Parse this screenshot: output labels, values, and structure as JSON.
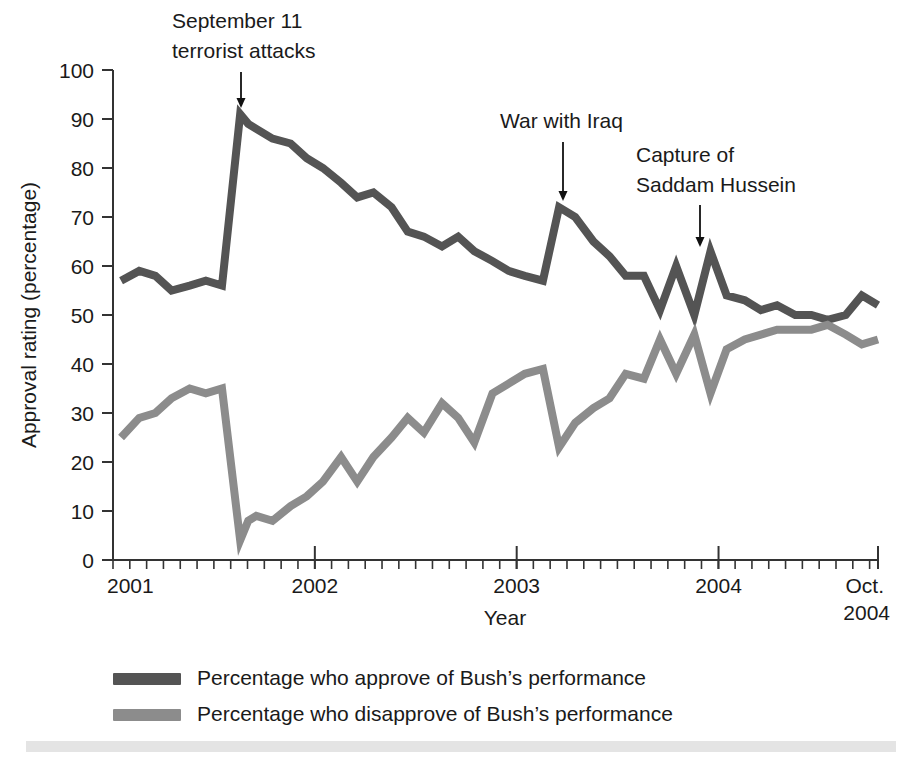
{
  "chart_data": {
    "type": "line",
    "title": "",
    "xlabel": "Year",
    "ylabel": "Approval rating (percentage)",
    "ylim": [
      0,
      100
    ],
    "yticks": [
      0,
      10,
      20,
      30,
      40,
      50,
      60,
      70,
      80,
      90,
      100
    ],
    "xlim": [
      2001.0,
      2004.79
    ],
    "xtick_labels": [
      "2001",
      "2002",
      "2003",
      "2004",
      "Oct.\n2004"
    ],
    "xtick_values": [
      2001,
      2002,
      2003,
      2004,
      2004.79
    ],
    "xtick_minor_interval": 0.0833,
    "grid": false,
    "legend_position": "below",
    "series": [
      {
        "name": "Percentage who approve of Bush's performance",
        "color": "#545454",
        "x": [
          2001.04,
          2001.13,
          2001.21,
          2001.29,
          2001.38,
          2001.46,
          2001.54,
          2001.63,
          2001.67,
          2001.71,
          2001.79,
          2001.88,
          2001.96,
          2002.04,
          2002.13,
          2002.21,
          2002.29,
          2002.38,
          2002.46,
          2002.54,
          2002.63,
          2002.71,
          2002.79,
          2002.88,
          2002.96,
          2003.04,
          2003.13,
          2003.21,
          2003.29,
          2003.38,
          2003.46,
          2003.54,
          2003.63,
          2003.71,
          2003.79,
          2003.88,
          2003.96,
          2004.04,
          2004.13,
          2004.21,
          2004.29,
          2004.38,
          2004.46,
          2004.54,
          2004.63,
          2004.71,
          2004.79
        ],
        "y": [
          57,
          59,
          58,
          55,
          56,
          57,
          56,
          91,
          89,
          88,
          86,
          85,
          82,
          80,
          77,
          74,
          75,
          72,
          67,
          66,
          64,
          66,
          63,
          61,
          59,
          58,
          57,
          72,
          70,
          65,
          62,
          58,
          58,
          51,
          60,
          50,
          63,
          54,
          53,
          51,
          52,
          50,
          50,
          49,
          50,
          54,
          52
        ],
        "marker": "none"
      },
      {
        "name": "Percentage who disapprove of Bush's performance",
        "color": "#8c8c8c",
        "x": [
          2001.04,
          2001.13,
          2001.21,
          2001.29,
          2001.38,
          2001.46,
          2001.54,
          2001.63,
          2001.67,
          2001.71,
          2001.79,
          2001.88,
          2001.96,
          2002.04,
          2002.13,
          2002.21,
          2002.29,
          2002.38,
          2002.46,
          2002.54,
          2002.63,
          2002.71,
          2002.79,
          2002.88,
          2002.96,
          2003.04,
          2003.13,
          2003.21,
          2003.29,
          2003.38,
          2003.46,
          2003.54,
          2003.63,
          2003.71,
          2003.79,
          2003.88,
          2003.96,
          2004.04,
          2004.13,
          2004.21,
          2004.29,
          2004.38,
          2004.46,
          2004.54,
          2004.63,
          2004.71,
          2004.79
        ],
        "y": [
          25,
          29,
          30,
          33,
          35,
          34,
          35,
          4,
          8,
          9,
          8,
          11,
          13,
          16,
          21,
          16,
          21,
          25,
          29,
          26,
          32,
          29,
          24,
          34,
          36,
          38,
          39,
          23,
          28,
          31,
          33,
          38,
          37,
          45,
          38,
          46,
          34,
          43,
          45,
          46,
          47,
          47,
          47,
          48,
          46,
          44,
          45
        ],
        "marker": "none"
      }
    ],
    "annotations": [
      {
        "name": "september-11",
        "text_line1": "September 11",
        "text_line2": "terrorist attacks",
        "target_x": 2001.63,
        "target_y": 95
      },
      {
        "name": "war-with-iraq",
        "text_line1": "War with Iraq",
        "text_line2": "",
        "target_x": 2003.21,
        "target_y": 76
      },
      {
        "name": "capture-of-saddam",
        "text_line1": "Capture of",
        "text_line2": "Saddam Hussein",
        "target_x": 2003.96,
        "target_y": 67
      }
    ]
  },
  "legend": {
    "items": [
      {
        "label": "Percentage who approve of Bush’s performance",
        "color": "#545454"
      },
      {
        "label": "Percentage who disapprove of Bush’s performance",
        "color": "#8c8c8c"
      }
    ]
  },
  "axes": {
    "y_title": "Approval rating (percentage)",
    "x_title": "Year",
    "y_ticks": [
      "100",
      "90",
      "80",
      "70",
      "60",
      "50",
      "40",
      "30",
      "20",
      "10",
      "0"
    ],
    "x_ticks": [
      "2001",
      "2002",
      "2003",
      "2004"
    ],
    "x_last_tick_line1": "Oct.",
    "x_last_tick_line2": "2004"
  },
  "annotations_text": {
    "a1_line1": "September 11",
    "a1_line2": "terrorist attacks",
    "a2_line1": "War with Iraq",
    "a3_line1": "Capture of",
    "a3_line2": "Saddam Hussein"
  },
  "colors": {
    "approve": "#545454",
    "disapprove": "#8c8c8c",
    "axis": "#333333",
    "text": "#1a1a1a",
    "footer_bar": "#e4e4e4",
    "background": "#ffffff"
  }
}
